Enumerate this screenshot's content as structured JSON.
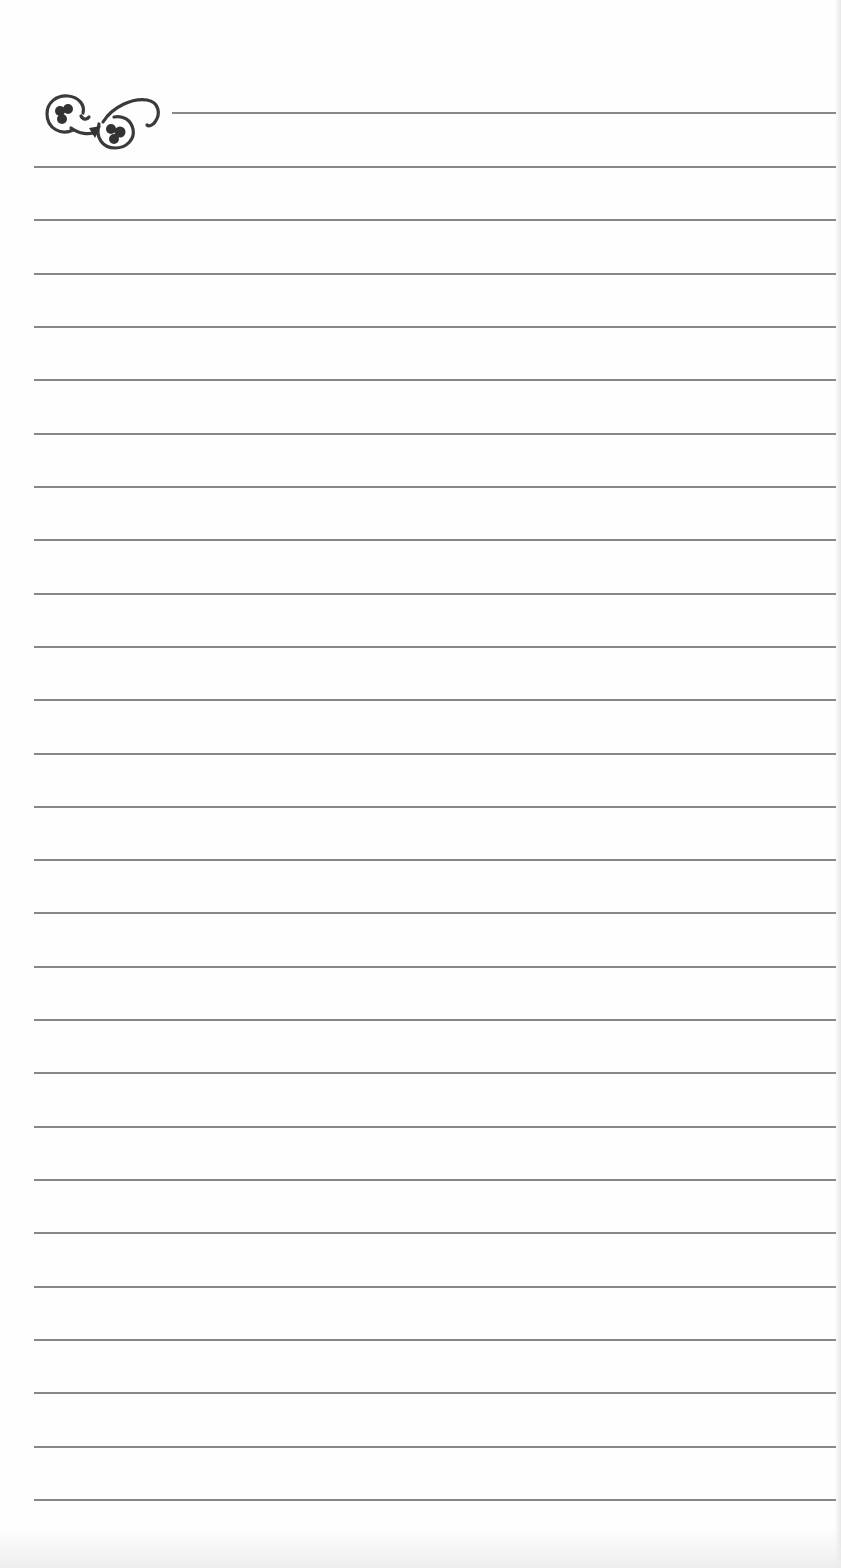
{
  "page": {
    "type": "lined-notepaper",
    "background_color": "#ffffff",
    "line_color": "#7a7a7a",
    "ornament": {
      "icon": "flourish-ornament-icon",
      "position": "top-left"
    },
    "header_rule": {
      "y": 112,
      "x_start": 172
    },
    "ruled_lines": {
      "count": 26,
      "first_y": 166,
      "spacing": 53.32,
      "x_start": 34
    }
  }
}
